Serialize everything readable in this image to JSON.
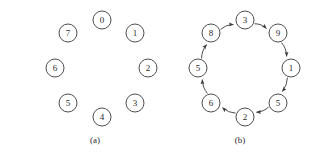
{
  "figure": {
    "background_color": "#ffffff",
    "stroke_color": "#3a3a3a",
    "text_color": "#2b2b2b",
    "panels": [
      {
        "id": "panel-a",
        "caption": "(a)",
        "caption_x": 95,
        "caption_y": 140,
        "type": "ring-of-nodes-no-edges",
        "description": "eight unconnected circled numbers arranged on a ring",
        "center_x": 102,
        "center_y": 68,
        "radius_x": 47,
        "radius_y": 48,
        "node_radius": 9,
        "nodes": [
          {
            "label": "0",
            "cx": 102,
            "cy": 20
          },
          {
            "label": "1",
            "cx": 135,
            "cy": 33
          },
          {
            "label": "2",
            "cx": 148,
            "cy": 68
          },
          {
            "label": "3",
            "cx": 135,
            "cy": 103
          },
          {
            "label": "4",
            "cx": 102,
            "cy": 117
          },
          {
            "label": "5",
            "cx": 68,
            "cy": 103
          },
          {
            "label": "6",
            "cx": 55,
            "cy": 68
          },
          {
            "label": "7",
            "cx": 68,
            "cy": 33
          }
        ],
        "edges": []
      },
      {
        "id": "panel-b",
        "caption": "(b)",
        "caption_x": 240,
        "caption_y": 140,
        "type": "directed-ring",
        "description": "eight circled numbers connected in a directed clockwise cycle",
        "center_x": 240,
        "center_y": 68,
        "radius_x": 47,
        "radius_y": 48,
        "node_radius": 9,
        "direction": "clockwise",
        "nodes": [
          {
            "label": "3",
            "cx": 245,
            "cy": 20
          },
          {
            "label": "9",
            "cx": 278,
            "cy": 33
          },
          {
            "label": "1",
            "cx": 291,
            "cy": 68
          },
          {
            "label": "5",
            "cx": 278,
            "cy": 103
          },
          {
            "label": "2",
            "cx": 245,
            "cy": 117
          },
          {
            "label": "6",
            "cx": 211,
            "cy": 103
          },
          {
            "label": "5",
            "cx": 198,
            "cy": 68
          },
          {
            "label": "8",
            "cx": 211,
            "cy": 33
          }
        ],
        "edges": [
          {
            "from": "3",
            "to": "9"
          },
          {
            "from": "9",
            "to": "1"
          },
          {
            "from": "1",
            "to": "5"
          },
          {
            "from": "5",
            "to": "2"
          },
          {
            "from": "2",
            "to": "6"
          },
          {
            "from": "6",
            "to": "5"
          },
          {
            "from": "5",
            "to": "8"
          },
          {
            "from": "8",
            "to": "3"
          }
        ]
      }
    ]
  }
}
